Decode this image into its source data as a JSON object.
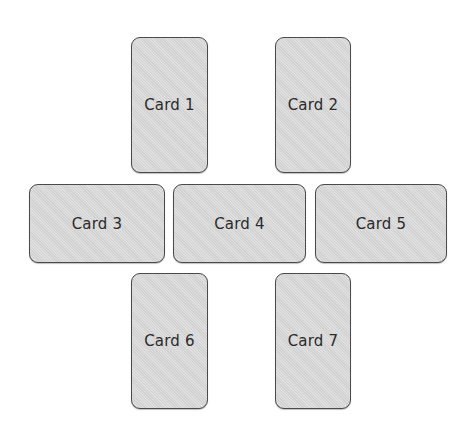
{
  "header": {
    "clipped_title": "▀▀ ▀ ▀▀ ▀▀▀▀▀▀▀▀ ▀▀▀▀▀ ▀▀▀▀▀ ▀ ▀▀▀▀▀"
  },
  "layout": {
    "description": "Seven cards arranged in a cross pattern: two portrait cards on top, three landscape cards in a middle row, two portrait cards on bottom",
    "card_fill": "#d8d8d8",
    "card_border": "#4a4a4a",
    "background": "#ffffff"
  },
  "cards": [
    {
      "label": "Card 1",
      "orientation": "portrait",
      "row": "top"
    },
    {
      "label": "Card 2",
      "orientation": "portrait",
      "row": "top"
    },
    {
      "label": "Card 3",
      "orientation": "landscape",
      "row": "middle"
    },
    {
      "label": "Card 4",
      "orientation": "landscape",
      "row": "middle"
    },
    {
      "label": "Card 5",
      "orientation": "landscape",
      "row": "middle"
    },
    {
      "label": "Card 6",
      "orientation": "portrait",
      "row": "bottom"
    },
    {
      "label": "Card 7",
      "orientation": "portrait",
      "row": "bottom"
    }
  ]
}
